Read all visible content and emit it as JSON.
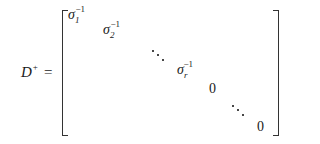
{
  "equation": {
    "lhs": {
      "symbol": "D",
      "superscript": "+",
      "equals": "="
    },
    "matrix": {
      "bracket": "square",
      "entries": [
        {
          "base": "σ",
          "subscript": "1",
          "superscript": "−1"
        },
        {
          "base": "σ",
          "subscript": "2",
          "superscript": "−1"
        },
        {
          "ellipsis": "diagonal"
        },
        {
          "base": "σ",
          "subscript": "r",
          "superscript": "−1"
        },
        {
          "value": "0"
        },
        {
          "ellipsis": "diagonal"
        },
        {
          "value": "0"
        }
      ]
    }
  }
}
